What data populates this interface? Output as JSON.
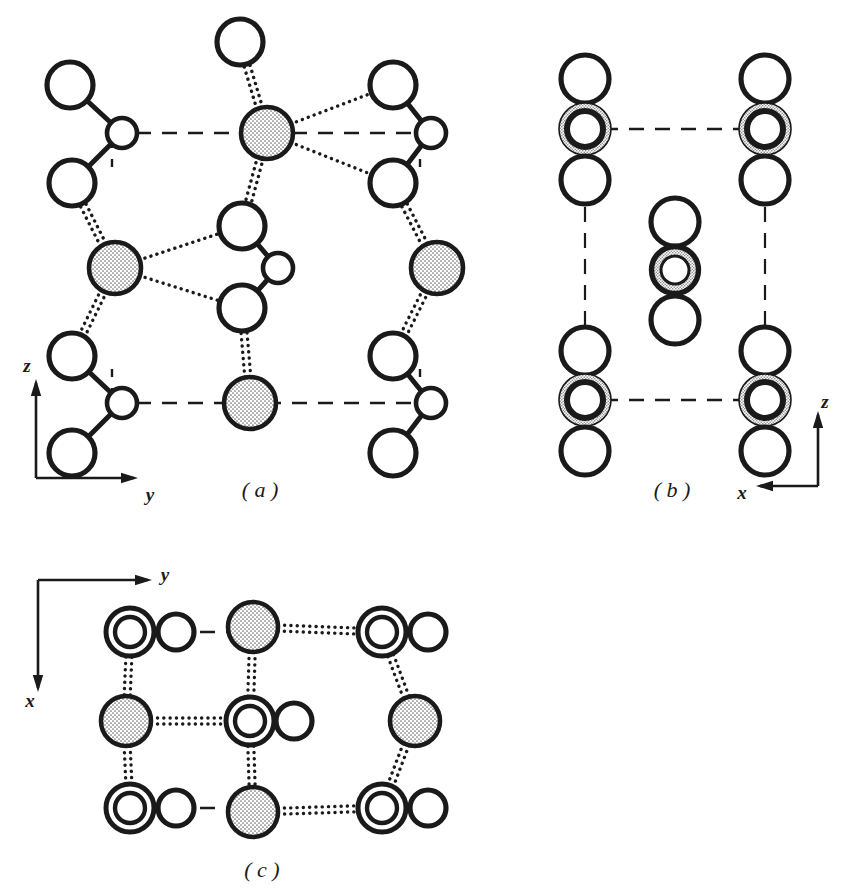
{
  "figure": {
    "title_hidden": "",
    "background_color": "#ffffff",
    "ink_color": "#1a1a1a",
    "stipple_color": "#b9b9b9",
    "panels": [
      {
        "id": "a",
        "label": "( a )",
        "label_x": 260,
        "label_y": 497,
        "projection": "yz",
        "axes": [
          {
            "name": "z",
            "label": "z",
            "label_x": 27,
            "label_y": 368,
            "dir": "up",
            "x1": 36,
            "y1": 478,
            "x2": 36,
            "y2": 383
          },
          {
            "name": "y",
            "label": "y",
            "label_x": 150,
            "label_y": 497,
            "dir": "right",
            "x1": 36,
            "y1": 478,
            "x2": 134,
            "y2": 478
          }
        ],
        "unit_cell": {
          "x1": 112,
          "y1": 133,
          "x2": 420,
          "y2": 403
        }
      },
      {
        "id": "b",
        "label": "( b )",
        "label_x": 672,
        "label_y": 497,
        "projection": "xz",
        "axes": [
          {
            "name": "z",
            "label": "z",
            "label_x": 825,
            "label_y": 404,
            "dir": "up",
            "x1": 818,
            "y1": 486,
            "x2": 818,
            "y2": 415
          },
          {
            "name": "x",
            "label": "x",
            "label_x": 742,
            "label_y": 495,
            "dir": "left",
            "x1": 818,
            "y1": 486,
            "x2": 760,
            "y2": 486
          }
        ],
        "unit_cell": {
          "x1": 585,
          "y1": 129,
          "x2": 765,
          "y2": 400
        }
      },
      {
        "id": "c",
        "label": "( c )",
        "label_x": 262,
        "label_y": 877,
        "projection": "xy",
        "axes": [
          {
            "name": "y",
            "label": "y",
            "label_x": 165,
            "label_y": 577,
            "dir": "right",
            "x1": 38,
            "y1": 580,
            "x2": 148,
            "y2": 580
          },
          {
            "name": "x",
            "label": "x",
            "label_x": 30,
            "label_y": 703,
            "dir": "down",
            "x1": 38,
            "y1": 580,
            "x2": 38,
            "y2": 688
          }
        ],
        "unit_cell": {
          "x1": 100,
          "y1": 632,
          "x2": 412,
          "y2": 808
        }
      }
    ],
    "legend_semantics": {
      "large_open_circle": "oxygen-atom-large-open",
      "small_open_circle": "atom-small-open",
      "stippled_filled_circle": "cation-stippled",
      "double_ring_stippled": "atom-overlapping-pair-stippled",
      "double_concentric_open": "atom-overlapping-pair-open",
      "solid_bond": "covalent-bond-solid",
      "dotted_bond": "ionic-or-long-bond-dotted",
      "dashed_line": "unit-cell-edge-dashed"
    },
    "panel_a_atoms": [
      {
        "kind": "large_open",
        "cx": 70,
        "cy": 85,
        "r": 23
      },
      {
        "kind": "small_open",
        "cx": 122,
        "cy": 133,
        "r": 15
      },
      {
        "kind": "large_open",
        "cx": 72,
        "cy": 183,
        "r": 23
      },
      {
        "kind": "stippled",
        "cx": 115,
        "cy": 268,
        "r": 26
      },
      {
        "kind": "large_open",
        "cx": 72,
        "cy": 356,
        "r": 23
      },
      {
        "kind": "small_open",
        "cx": 122,
        "cy": 403,
        "r": 15
      },
      {
        "kind": "large_open",
        "cx": 72,
        "cy": 453,
        "r": 23
      },
      {
        "kind": "large_open",
        "cx": 240,
        "cy": 42,
        "r": 23
      },
      {
        "kind": "stippled",
        "cx": 267,
        "cy": 133,
        "r": 26
      },
      {
        "kind": "large_open",
        "cx": 242,
        "cy": 226,
        "r": 23
      },
      {
        "kind": "small_open",
        "cx": 278,
        "cy": 268,
        "r": 15
      },
      {
        "kind": "large_open",
        "cx": 242,
        "cy": 308,
        "r": 23
      },
      {
        "kind": "stippled",
        "cx": 250,
        "cy": 403,
        "r": 26
      },
      {
        "kind": "large_open",
        "cx": 393,
        "cy": 85,
        "r": 23
      },
      {
        "kind": "small_open",
        "cx": 431,
        "cy": 133,
        "r": 15
      },
      {
        "kind": "large_open",
        "cx": 393,
        "cy": 183,
        "r": 23
      },
      {
        "kind": "stippled",
        "cx": 437,
        "cy": 268,
        "r": 26
      },
      {
        "kind": "large_open",
        "cx": 393,
        "cy": 356,
        "r": 23
      },
      {
        "kind": "small_open",
        "cx": 431,
        "cy": 403,
        "r": 15
      },
      {
        "kind": "large_open",
        "cx": 393,
        "cy": 453,
        "r": 23
      }
    ],
    "panel_a_bonds_solid": [
      {
        "x1": 70,
        "y1": 85,
        "x2": 122,
        "y2": 133
      },
      {
        "x1": 122,
        "y1": 133,
        "x2": 72,
        "y2": 183
      },
      {
        "x1": 72,
        "y1": 356,
        "x2": 122,
        "y2": 403
      },
      {
        "x1": 122,
        "y1": 403,
        "x2": 72,
        "y2": 453
      },
      {
        "x1": 393,
        "y1": 85,
        "x2": 431,
        "y2": 133
      },
      {
        "x1": 431,
        "y1": 133,
        "x2": 393,
        "y2": 183
      },
      {
        "x1": 393,
        "y1": 356,
        "x2": 431,
        "y2": 403
      },
      {
        "x1": 431,
        "y1": 403,
        "x2": 393,
        "y2": 453
      },
      {
        "x1": 242,
        "y1": 226,
        "x2": 278,
        "y2": 268
      },
      {
        "x1": 278,
        "y1": 268,
        "x2": 242,
        "y2": 308
      }
    ],
    "panel_a_bonds_dotted": [
      {
        "x1": 240,
        "y1": 42,
        "x2": 267,
        "y2": 133,
        "double": true
      },
      {
        "x1": 267,
        "y1": 133,
        "x2": 393,
        "y2": 85,
        "double": false
      },
      {
        "x1": 267,
        "y1": 133,
        "x2": 393,
        "y2": 183,
        "double": false
      },
      {
        "x1": 267,
        "y1": 133,
        "x2": 242,
        "y2": 226,
        "double": true
      },
      {
        "x1": 115,
        "y1": 268,
        "x2": 242,
        "y2": 226,
        "double": false
      },
      {
        "x1": 115,
        "y1": 268,
        "x2": 242,
        "y2": 308,
        "double": false
      },
      {
        "x1": 72,
        "y1": 183,
        "x2": 115,
        "y2": 268,
        "double": true
      },
      {
        "x1": 115,
        "y1": 268,
        "x2": 72,
        "y2": 356,
        "double": true
      },
      {
        "x1": 393,
        "y1": 183,
        "x2": 437,
        "y2": 268,
        "double": true
      },
      {
        "x1": 437,
        "y1": 268,
        "x2": 393,
        "y2": 356,
        "double": true
      },
      {
        "x1": 242,
        "y1": 308,
        "x2": 250,
        "y2": 403,
        "double": true
      }
    ],
    "panel_b_atoms": [
      {
        "kind": "large_open",
        "cx": 585,
        "cy": 79,
        "r": 24
      },
      {
        "kind": "ring_stip",
        "cx": 585,
        "cy": 129,
        "r": 26
      },
      {
        "kind": "large_open",
        "cx": 585,
        "cy": 180,
        "r": 24
      },
      {
        "kind": "large_open",
        "cx": 585,
        "cy": 351,
        "r": 24
      },
      {
        "kind": "ring_stip",
        "cx": 585,
        "cy": 400,
        "r": 26
      },
      {
        "kind": "large_open",
        "cx": 585,
        "cy": 451,
        "r": 24
      },
      {
        "kind": "large_open",
        "cx": 765,
        "cy": 79,
        "r": 24
      },
      {
        "kind": "ring_stip",
        "cx": 765,
        "cy": 129,
        "r": 26
      },
      {
        "kind": "large_open",
        "cx": 765,
        "cy": 180,
        "r": 24
      },
      {
        "kind": "large_open",
        "cx": 765,
        "cy": 351,
        "r": 24
      },
      {
        "kind": "ring_stip",
        "cx": 765,
        "cy": 400,
        "r": 26
      },
      {
        "kind": "large_open",
        "cx": 765,
        "cy": 451,
        "r": 24
      },
      {
        "kind": "large_open",
        "cx": 675,
        "cy": 222,
        "r": 24
      },
      {
        "kind": "ring_bold",
        "cx": 675,
        "cy": 270,
        "r": 26
      },
      {
        "kind": "large_open",
        "cx": 675,
        "cy": 320,
        "r": 24
      }
    ],
    "panel_b_bonds_solid": [
      {
        "x1": 585,
        "y1": 79,
        "x2": 585,
        "y2": 129
      },
      {
        "x1": 585,
        "y1": 129,
        "x2": 585,
        "y2": 180
      },
      {
        "x1": 585,
        "y1": 351,
        "x2": 585,
        "y2": 400
      },
      {
        "x1": 585,
        "y1": 400,
        "x2": 585,
        "y2": 451
      },
      {
        "x1": 765,
        "y1": 79,
        "x2": 765,
        "y2": 129
      },
      {
        "x1": 765,
        "y1": 129,
        "x2": 765,
        "y2": 180
      },
      {
        "x1": 765,
        "y1": 351,
        "x2": 765,
        "y2": 400
      },
      {
        "x1": 765,
        "y1": 400,
        "x2": 765,
        "y2": 451
      },
      {
        "x1": 675,
        "y1": 222,
        "x2": 675,
        "y2": 270
      },
      {
        "x1": 675,
        "y1": 270,
        "x2": 675,
        "y2": 320
      }
    ],
    "panel_c_atoms": [
      {
        "kind": "double_open",
        "cx": 130,
        "cy": 632,
        "r": 24
      },
      {
        "kind": "med_open",
        "cx": 176,
        "cy": 632,
        "r": 18
      },
      {
        "kind": "stippled",
        "cx": 253,
        "cy": 627,
        "r": 25
      },
      {
        "kind": "double_open",
        "cx": 382,
        "cy": 632,
        "r": 24
      },
      {
        "kind": "med_open",
        "cx": 428,
        "cy": 632,
        "r": 18
      },
      {
        "kind": "stippled",
        "cx": 126,
        "cy": 721,
        "r": 25
      },
      {
        "kind": "double_open",
        "cx": 250,
        "cy": 721,
        "r": 24
      },
      {
        "kind": "med_open",
        "cx": 294,
        "cy": 721,
        "r": 18
      },
      {
        "kind": "stippled",
        "cx": 415,
        "cy": 721,
        "r": 25
      },
      {
        "kind": "double_open",
        "cx": 130,
        "cy": 808,
        "r": 24
      },
      {
        "kind": "med_open",
        "cx": 176,
        "cy": 808,
        "r": 18
      },
      {
        "kind": "stippled",
        "cx": 253,
        "cy": 812,
        "r": 25
      },
      {
        "kind": "double_open",
        "cx": 382,
        "cy": 808,
        "r": 24
      },
      {
        "kind": "med_open",
        "cx": 428,
        "cy": 808,
        "r": 18
      }
    ],
    "panel_c_bonds_dotted": [
      {
        "x1": 253,
        "y1": 627,
        "x2": 382,
        "y2": 632,
        "double": true
      },
      {
        "x1": 253,
        "y1": 812,
        "x2": 382,
        "y2": 808,
        "double": true
      },
      {
        "x1": 126,
        "y1": 721,
        "x2": 250,
        "y2": 721,
        "double": true
      },
      {
        "x1": 130,
        "y1": 632,
        "x2": 126,
        "y2": 721,
        "double": true
      },
      {
        "x1": 126,
        "y1": 721,
        "x2": 130,
        "y2": 808,
        "double": true
      },
      {
        "x1": 382,
        "y1": 632,
        "x2": 415,
        "y2": 721,
        "double": true
      },
      {
        "x1": 415,
        "y1": 721,
        "x2": 382,
        "y2": 808,
        "double": true
      },
      {
        "x1": 253,
        "y1": 627,
        "x2": 250,
        "y2": 721,
        "double": true
      },
      {
        "x1": 250,
        "y1": 721,
        "x2": 253,
        "y2": 812,
        "double": true
      }
    ],
    "panel_c_cell_dashes": [
      {
        "x1": 200,
        "y1": 632,
        "x2": 228,
        "y2": 632
      },
      {
        "x1": 200,
        "y1": 808,
        "x2": 228,
        "y2": 808
      }
    ]
  }
}
